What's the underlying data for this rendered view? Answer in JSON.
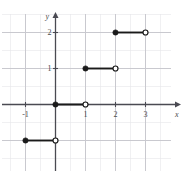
{
  "figure": {
    "kind": "cartesian-step-function-graph",
    "background_color": "#ffffff",
    "grid_color": "#c9c9cf",
    "minor_grid_color": "#e6e6ea",
    "axis_color": "#4a4a52",
    "curve_color": "#1a1a1a",
    "open_point_fill": "#ffffff"
  },
  "axes": {
    "x_axis_label": "x",
    "y_axis_label": "y",
    "x_ticks": [
      {
        "value": -1,
        "label": "-1"
      },
      {
        "value": 1,
        "label": "1"
      },
      {
        "value": 2,
        "label": "2"
      },
      {
        "value": 3,
        "label": "3"
      }
    ],
    "y_ticks": [
      {
        "value": 1,
        "label": "1"
      },
      {
        "value": 2,
        "label": "2"
      }
    ],
    "xlim": [
      -1.85,
      3.9
    ],
    "ylim": [
      -1.95,
      2.45
    ],
    "grid": true
  },
  "chart_data": {
    "type": "line",
    "title": "",
    "xlabel": "x",
    "ylabel": "y",
    "xlim": [
      -1.85,
      3.9
    ],
    "ylim": [
      -1.95,
      2.45
    ],
    "grid": true,
    "legend": "none",
    "series": [
      {
        "name": "step-segments",
        "segments": [
          {
            "y": -1,
            "x_start": -1,
            "x_end": 0,
            "left_endpoint": "closed",
            "right_endpoint": "open"
          },
          {
            "y": 0,
            "x_start": 0,
            "x_end": 1,
            "left_endpoint": "closed",
            "right_endpoint": "open"
          },
          {
            "y": 1,
            "x_start": 1,
            "x_end": 2,
            "left_endpoint": "closed",
            "right_endpoint": "open"
          },
          {
            "y": 2,
            "x_start": 2,
            "x_end": 3,
            "left_endpoint": "closed",
            "right_endpoint": "open"
          }
        ]
      }
    ],
    "closed_points": [
      {
        "x": -1,
        "y": -1
      },
      {
        "x": 0,
        "y": 0
      },
      {
        "x": 1,
        "y": 1
      },
      {
        "x": 2,
        "y": 2
      }
    ],
    "open_points": [
      {
        "x": 0,
        "y": -1
      },
      {
        "x": 1,
        "y": 0
      },
      {
        "x": 2,
        "y": 1
      },
      {
        "x": 3,
        "y": 2
      }
    ]
  }
}
